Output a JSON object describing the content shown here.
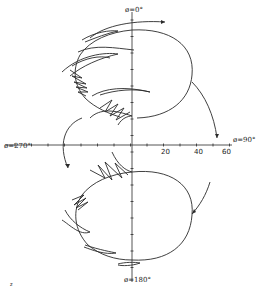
{
  "figure": {
    "type": "polar-trajectory-diagram",
    "axis_labels": {
      "top": "ø=0°",
      "left": "ø=270°",
      "right": "ø=90°",
      "bottom": "ø=180°"
    },
    "radial_ticks": [
      "20",
      "40",
      "60"
    ],
    "corner_mark": "z"
  },
  "colors": {
    "ink": "#2a2a2a",
    "background": "#ffffff"
  }
}
